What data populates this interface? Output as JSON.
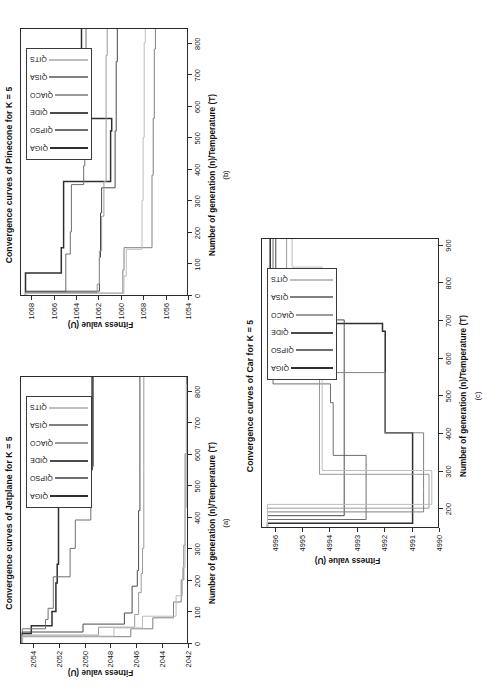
{
  "figure": {
    "orientation": "rotated-90-ccw",
    "background": "#ffffff",
    "panels_count": 3
  },
  "series_names": [
    "QIGA",
    "QIPSO",
    "QIDE",
    "QIACO",
    "QISA",
    "QITS"
  ],
  "series_colors": [
    "#2f2f2f",
    "#6e6e6e",
    "#4a4a4a",
    "#9a9a9a",
    "#808080",
    "#bdbdbd"
  ],
  "common": {
    "xlabel": "Number of generation (n)/Temperature (T)",
    "ylabel": "Fitness value (U)"
  },
  "panel_a": {
    "caption": "(a)",
    "title": "Convergence curves of Jetplane for K = 5",
    "xlabel": "Number of generation (n)/Temperature (T)",
    "ylabel": "Fitness value (U)",
    "xticks": [
      "0",
      "100",
      "200",
      "300",
      "400",
      "500",
      "600",
      "700",
      "800"
    ],
    "yticks": [
      "2042",
      "2044",
      "2046",
      "2048",
      "2050",
      "2052",
      "2054"
    ],
    "legend": [
      "QIGA",
      "QIPSO",
      "QIDE",
      "QIACO",
      "QISA",
      "QITS"
    ]
  },
  "panel_b": {
    "caption": "(b)",
    "title": "Convergence curves of Pinecone for K = 5",
    "xlabel": "Number of generation (n)/Temperature (T)",
    "ylabel": "Fitness value (U)",
    "xticks": [
      "0",
      "100",
      "200",
      "300",
      "400",
      "500",
      "600",
      "700",
      "800"
    ],
    "yticks": [
      "1054",
      "1056",
      "1058",
      "1060",
      "1062",
      "1064",
      "1066",
      "1068"
    ],
    "legend": [
      "QIGA",
      "QIPSO",
      "QIDE",
      "QIACO",
      "QISA",
      "QITS"
    ]
  },
  "panel_c": {
    "caption": "(c)",
    "title": "Convergence curves of Car for K = 5",
    "xlabel": "Number of generation (n)/Temperature (T)",
    "ylabel": "Fitness value (U)",
    "xticks": [
      "200",
      "300",
      "400",
      "500",
      "600",
      "700",
      "800",
      "900"
    ],
    "yticks": [
      "4990",
      "4991",
      "4992",
      "4993",
      "4994",
      "4995",
      "4996"
    ],
    "legend": [
      "QIGA",
      "QIPSO",
      "QIDE",
      "QIACO",
      "QISA",
      "QITS"
    ]
  },
  "chart_data": [
    {
      "id": "panel_a",
      "type": "line",
      "title": "Convergence curves of Jetplane for K = 5",
      "xlabel": "Number of generation (n)/Temperature (T)",
      "ylabel": "Fitness value (U)",
      "xlim": [
        0,
        850
      ],
      "ylim": [
        2042,
        2055
      ],
      "grid": false,
      "legend_position": "upper-right",
      "step": "post",
      "series": [
        {
          "name": "QIGA",
          "color": "#2f2f2f",
          "x": [
            0,
            30,
            55,
            100,
            190,
            250,
            550,
            850
          ],
          "y": [
            2054.9,
            2054.2,
            2052.6,
            2052.3,
            2052.2,
            2052.1,
            2049.5,
            2049.5
          ]
        },
        {
          "name": "QIPSO",
          "color": "#6e6e6e",
          "x": [
            0,
            45,
            75,
            110,
            210,
            300,
            390,
            560,
            850
          ],
          "y": [
            2054.9,
            2053.1,
            2052.9,
            2052.5,
            2051.2,
            2050.8,
            2049.6,
            2049.4,
            2049.4
          ]
        },
        {
          "name": "QIDE",
          "color": "#4a4a4a",
          "x": [
            0,
            35,
            60,
            95,
            180,
            230,
            420,
            700,
            850
          ],
          "y": [
            2054.9,
            2050.2,
            2047.0,
            2046.4,
            2046.0,
            2045.9,
            2045.8,
            2045.8,
            2045.8
          ]
        },
        {
          "name": "QIACO",
          "color": "#9a9a9a",
          "x": [
            0,
            25,
            50,
            90,
            160,
            220,
            300,
            560,
            850
          ],
          "y": [
            2054.9,
            2049.0,
            2046.2,
            2045.9,
            2045.7,
            2045.6,
            2045.5,
            2045.5,
            2045.5
          ]
        },
        {
          "name": "QISA",
          "color": "#808080",
          "x": [
            0,
            20,
            45,
            80,
            130,
            200,
            310,
            600,
            850
          ],
          "y": [
            2054.9,
            2046.5,
            2044.8,
            2043.2,
            2042.6,
            2042.4,
            2042.3,
            2042.2,
            2042.2
          ]
        },
        {
          "name": "QITS",
          "color": "#bdbdbd",
          "x": [
            0,
            22,
            48,
            85,
            150,
            240,
            430,
            820,
            850
          ],
          "y": [
            2054.9,
            2047.8,
            2045.6,
            2043.0,
            2042.5,
            2042.3,
            2042.2,
            2042.1,
            2042.1
          ]
        }
      ]
    },
    {
      "id": "panel_b",
      "type": "line",
      "title": "Convergence curves of Pinecone for K = 5",
      "xlabel": "Number of generation (n)/Temperature (T)",
      "ylabel": "Fitness value (U)",
      "xlim": [
        0,
        850
      ],
      "ylim": [
        1054,
        1069
      ],
      "grid": false,
      "legend_position": "upper-right",
      "step": "post",
      "series": [
        {
          "name": "QIGA",
          "color": "#2f2f2f",
          "x": [
            0,
            70,
            150,
            360,
            520,
            560,
            850
          ],
          "y": [
            1068.6,
            1065.4,
            1065.2,
            1061.0,
            1060.9,
            1063.6,
            1063.6
          ]
        },
        {
          "name": "QIPSO",
          "color": "#6e6e6e",
          "x": [
            0,
            10,
            130,
            200,
            350,
            410,
            600,
            850
          ],
          "y": [
            1068.6,
            1065.0,
            1064.6,
            1064.5,
            1063.4,
            1063.3,
            1063.2,
            1063.2
          ]
        },
        {
          "name": "QIDE",
          "color": "#4a4a4a",
          "x": [
            0,
            12,
            120,
            260,
            340,
            520,
            740,
            850
          ],
          "y": [
            1068.6,
            1062.0,
            1061.9,
            1061.8,
            1060.6,
            1060.5,
            1060.4,
            1060.4
          ]
        },
        {
          "name": "QIACO",
          "color": "#9a9a9a",
          "x": [
            0,
            8,
            35,
            140,
            250,
            360,
            760,
            850
          ],
          "y": [
            1068.6,
            1062.2,
            1062.0,
            1061.8,
            1061.6,
            1061.4,
            1061.3,
            1061.3
          ]
        },
        {
          "name": "QISA",
          "color": "#808080",
          "x": [
            0,
            6,
            80,
            150,
            380,
            560,
            780,
            850
          ],
          "y": [
            1068.6,
            1059.9,
            1059.8,
            1057.3,
            1057.2,
            1057.1,
            1057.0,
            1057.0
          ]
        },
        {
          "name": "QITS",
          "color": "#bdbdbd",
          "x": [
            0,
            5,
            60,
            145,
            300,
            500,
            800,
            850
          ],
          "y": [
            1068.6,
            1059.8,
            1059.6,
            1058.2,
            1058.1,
            1058.0,
            1057.9,
            1057.9
          ]
        }
      ]
    },
    {
      "id": "panel_c",
      "type": "line",
      "title": "Convergence curves of Car for K = 5",
      "xlabel": "Number of generation (n)/Temperature (T)",
      "ylabel": "Fitness value (U)",
      "xlim": [
        150,
        920
      ],
      "ylim": [
        4990,
        4996.5
      ],
      "grid": false,
      "legend_position": "upper-right",
      "step": "post",
      "series": [
        {
          "name": "QIGA",
          "color": "#2f2f2f",
          "x": [
            150,
            160,
            250,
            400,
            530,
            670,
            690,
            920
          ],
          "y": [
            4996.3,
            4991.0,
            4991.0,
            4992.0,
            4992.0,
            4992.1,
            4996.2,
            4996.2
          ]
        },
        {
          "name": "QIPSO",
          "color": "#6e6e6e",
          "x": [
            150,
            170,
            250,
            340,
            480,
            530,
            800,
            920
          ],
          "y": [
            4996.3,
            4992.7,
            4992.7,
            4993.9,
            4994.0,
            4996.1,
            4996.1,
            4996.1
          ]
        },
        {
          "name": "QIDE",
          "color": "#4a4a4a",
          "x": [
            150,
            180,
            290,
            310,
            680,
            700,
            920
          ],
          "y": [
            4996.3,
            4993.5,
            4993.5,
            4993.5,
            4993.5,
            4996.0,
            4996.0
          ]
        },
        {
          "name": "QIACO",
          "color": "#9a9a9a",
          "x": [
            150,
            200,
            270,
            290,
            800,
            830,
            920
          ],
          "y": [
            4996.3,
            4990.4,
            4990.4,
            4994.4,
            4994.4,
            4995.6,
            4995.6
          ]
        },
        {
          "name": "QISA",
          "color": "#808080",
          "x": [
            150,
            190,
            250,
            400,
            540,
            560,
            920
          ],
          "y": [
            4996.3,
            4990.6,
            4990.6,
            4992.0,
            4992.0,
            4996.0,
            4996.0
          ]
        },
        {
          "name": "QITS",
          "color": "#bdbdbd",
          "x": [
            150,
            210,
            280,
            300,
            820,
            840,
            920
          ],
          "y": [
            4996.3,
            4990.3,
            4990.3,
            4994.3,
            4994.3,
            4995.4,
            4995.4
          ]
        }
      ]
    }
  ]
}
